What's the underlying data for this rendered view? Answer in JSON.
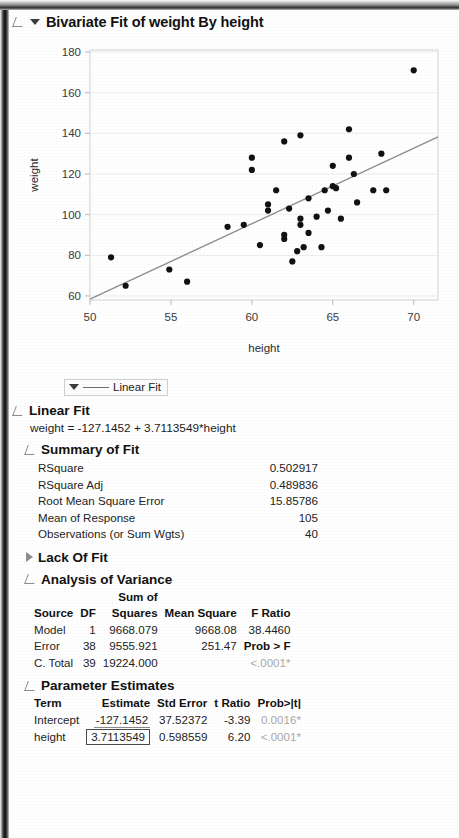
{
  "window": {
    "title": "Bivariate Fit of weight By height",
    "disclosure_open_icon": "triangle-open-icon",
    "menu_icon": "chevron-down-icon"
  },
  "plot": {
    "x_axis": {
      "label": "height",
      "ticks": [
        50,
        55,
        60,
        65,
        70
      ],
      "min": 50,
      "max": 71.5
    },
    "y_axis": {
      "label": "weight",
      "ticks": [
        60,
        80,
        100,
        120,
        140,
        160,
        180
      ],
      "min": 58,
      "max": 181
    },
    "fit_line_color": "#8a8a8a",
    "point_color": "#111111"
  },
  "chart_data": {
    "type": "scatter",
    "title": "Bivariate Fit of weight By height",
    "xlabel": "height",
    "ylabel": "weight",
    "xlim": [
      50,
      71.5
    ],
    "ylim": [
      58,
      181
    ],
    "xticks": [
      50,
      55,
      60,
      65,
      70
    ],
    "yticks": [
      60,
      80,
      100,
      120,
      140,
      160,
      180
    ],
    "grid": false,
    "legend": [
      "Linear Fit"
    ],
    "legend_position": "below-plot-left",
    "series": [
      {
        "name": "weight vs height",
        "marker": "filled-circle",
        "points": [
          [
            51.3,
            79
          ],
          [
            52.2,
            65
          ],
          [
            54.9,
            73
          ],
          [
            56.0,
            67
          ],
          [
            58.5,
            94
          ],
          [
            59.5,
            95
          ],
          [
            60.0,
            128
          ],
          [
            60.0,
            122
          ],
          [
            60.5,
            85
          ],
          [
            61.0,
            105
          ],
          [
            61.0,
            102
          ],
          [
            61.5,
            112
          ],
          [
            62.0,
            136
          ],
          [
            62.0,
            90
          ],
          [
            62.0,
            88
          ],
          [
            62.3,
            103
          ],
          [
            62.5,
            77
          ],
          [
            62.8,
            82
          ],
          [
            63.0,
            139
          ],
          [
            63.0,
            98
          ],
          [
            63.0,
            95
          ],
          [
            63.2,
            84
          ],
          [
            63.5,
            108
          ],
          [
            63.5,
            91
          ],
          [
            64.0,
            99
          ],
          [
            64.3,
            84
          ],
          [
            64.5,
            112
          ],
          [
            64.7,
            102
          ],
          [
            65.0,
            124
          ],
          [
            65.0,
            114
          ],
          [
            65.2,
            113
          ],
          [
            65.5,
            98
          ],
          [
            66.0,
            142
          ],
          [
            66.0,
            128
          ],
          [
            66.3,
            120
          ],
          [
            66.5,
            106
          ],
          [
            67.5,
            112
          ],
          [
            68.0,
            130
          ],
          [
            68.3,
            112
          ],
          [
            70.0,
            171
          ]
        ]
      }
    ],
    "fit_line": {
      "name": "Linear Fit",
      "intercept": -127.1452,
      "slope": 3.7113549,
      "equation": "weight = -127.1452 + 3.7113549*height"
    }
  },
  "fit_legend": {
    "label": "Linear Fit",
    "menu_icon": "chevron-down-icon",
    "line_swatch": "line-swatch-icon"
  },
  "linear_fit": {
    "heading": "Linear Fit",
    "equation": "weight = -127.1452 + 3.7113549*height"
  },
  "summary_of_fit": {
    "heading": "Summary of Fit",
    "rows": [
      {
        "label": "RSquare",
        "value": "0.502917"
      },
      {
        "label": "RSquare Adj",
        "value": "0.489836"
      },
      {
        "label": "Root Mean Square Error",
        "value": "15.85786"
      },
      {
        "label": "Mean of Response",
        "value": "105"
      },
      {
        "label": "Observations (or Sum Wgts)",
        "value": "40"
      }
    ]
  },
  "lack_of_fit": {
    "heading": "Lack Of Fit",
    "collapsed": true,
    "disclosure_icon": "triangle-closed-icon"
  },
  "analysis_of_variance": {
    "heading": "Analysis of Variance",
    "group_header": "Sum of",
    "columns": [
      "Source",
      "DF",
      "Squares",
      "Mean Square",
      "F Ratio"
    ],
    "rows": [
      {
        "source": "Model",
        "df": "1",
        "sum_squares": "9668.079",
        "mean_square": "9668.08",
        "f_ratio": "38.4460"
      },
      {
        "source": "Error",
        "df": "38",
        "sum_squares": "9555.921",
        "mean_square": "251.47",
        "f_ratio": "Prob > F"
      },
      {
        "source": "C. Total",
        "df": "39",
        "sum_squares": "19224.000",
        "mean_square": "",
        "f_ratio": "<.0001*"
      }
    ]
  },
  "parameter_estimates": {
    "heading": "Parameter Estimates",
    "columns": [
      "Term",
      "Estimate",
      "Std Error",
      "t Ratio",
      "Prob>|t|"
    ],
    "rows": [
      {
        "term": "Intercept",
        "estimate": "-127.1452",
        "std_error": "37.52372",
        "t_ratio": "-3.39",
        "prob": "0.0016*"
      },
      {
        "term": "height",
        "estimate": "3.7113549",
        "std_error": "0.598559",
        "t_ratio": "6.20",
        "prob": "<.0001*"
      }
    ]
  }
}
